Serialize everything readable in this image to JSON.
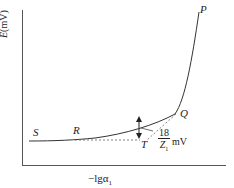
{
  "diagram": {
    "y_axis": {
      "label_var": "E",
      "label_unit": "(mV)"
    },
    "x_axis": {
      "label_main": "−lgα",
      "label_sub": "1"
    },
    "points": {
      "S": "S",
      "R": "R",
      "T": "T",
      "Q": "Q",
      "P": "P"
    },
    "annotation": {
      "numerator": "18",
      "denominator_var": "Z",
      "denominator_sub": "1",
      "unit": "mV"
    },
    "colors": {
      "line": "#444444",
      "text": "#222222",
      "dashed": "#666666"
    }
  }
}
